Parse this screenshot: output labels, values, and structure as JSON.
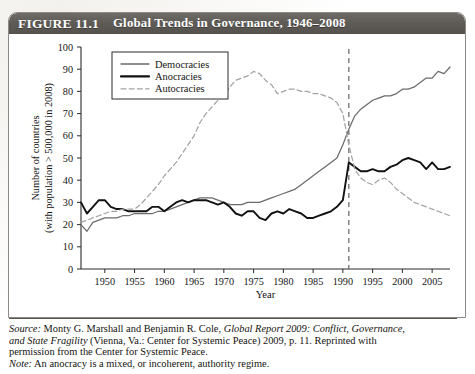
{
  "figure": {
    "number": "FIGURE 11.1",
    "title": "Global Trends in Governance, 1946–2008"
  },
  "caption": {
    "source_label": "Source:",
    "source_line1_a": " Monty G. Marshall and Benjamin R. Cole, ",
    "source_line1_italic": "Global Report 2009: Conflict, Governance,",
    "source_line2_italic": "and State Fragility",
    "source_line2_a": " (Vienna, Va.: Center for Systemic Peace) 2009, p. 11. Reprinted with",
    "source_line3": "permission from the Center for Systemic Peace.",
    "note_label": "Note:",
    "note_text": " An anocracy is a mixed, or incoherent, authority regime."
  },
  "colors": {
    "democracies": "#6b6b6b",
    "anocracies": "#111111",
    "autocracies": "#a3a3a3",
    "axis": "#2b2b2b",
    "header_bg": "#5f5c58",
    "card_border": "#8d8a85",
    "marker_line": "#6e6e6e"
  },
  "chart_data": {
    "type": "line",
    "title": "Global Trends in Governance, 1946–2008",
    "xlabel": "Year",
    "ylabel": "Number of countries (with population > 500,000 in 2008)",
    "ylabel_line1": "Number of countries",
    "ylabel_line2": "(with population > 500,000 in 2008)",
    "xlim": [
      1946,
      2008
    ],
    "ylim": [
      0,
      100
    ],
    "xticks": [
      1950,
      1955,
      1960,
      1965,
      1970,
      1975,
      1980,
      1985,
      1990,
      1995,
      2000,
      2005
    ],
    "yticks": [
      0,
      10,
      20,
      30,
      40,
      50,
      60,
      70,
      80,
      90,
      100
    ],
    "grid": false,
    "legend_position": "top-left",
    "annotations": [
      {
        "type": "vline",
        "x": 1991,
        "style": "dashed",
        "label": ""
      }
    ],
    "x": [
      1946,
      1947,
      1948,
      1949,
      1950,
      1951,
      1952,
      1953,
      1954,
      1955,
      1956,
      1957,
      1958,
      1959,
      1960,
      1961,
      1962,
      1963,
      1964,
      1965,
      1966,
      1967,
      1968,
      1969,
      1970,
      1971,
      1972,
      1973,
      1974,
      1975,
      1976,
      1977,
      1978,
      1979,
      1980,
      1981,
      1982,
      1983,
      1984,
      1985,
      1986,
      1987,
      1988,
      1989,
      1990,
      1991,
      1992,
      1993,
      1994,
      1995,
      1996,
      1997,
      1998,
      1999,
      2000,
      2001,
      2002,
      2003,
      2004,
      2005,
      2006,
      2007,
      2008
    ],
    "series": [
      {
        "name": "Democracies",
        "style": "solid",
        "color": "#6b6b6b",
        "values": [
          20,
          17,
          21,
          22,
          23,
          23,
          23,
          24,
          24,
          25,
          25,
          25,
          25,
          26,
          26,
          27,
          28,
          29,
          30,
          31,
          32,
          32,
          32,
          31,
          30,
          29,
          29,
          29,
          30,
          30,
          30,
          31,
          32,
          33,
          34,
          35,
          36,
          38,
          40,
          42,
          44,
          46,
          48,
          50,
          56,
          63,
          69,
          72,
          74,
          76,
          77,
          78,
          78,
          79,
          81,
          81,
          82,
          84,
          86,
          86,
          89,
          88,
          91
        ]
      },
      {
        "name": "Anocracies",
        "style": "solid",
        "color": "#111111",
        "values": [
          30,
          25,
          28,
          31,
          31,
          28,
          27,
          27,
          26,
          26,
          26,
          26,
          28,
          28,
          26,
          28,
          30,
          31,
          30,
          31,
          31,
          31,
          30,
          29,
          30,
          28,
          25,
          24,
          26,
          26,
          23,
          22,
          25,
          26,
          25,
          27,
          26,
          25,
          23,
          23,
          24,
          25,
          26,
          28,
          31,
          48,
          46,
          44,
          44,
          45,
          44,
          44,
          46,
          47,
          49,
          50,
          49,
          48,
          45,
          48,
          45,
          45,
          46
        ]
      },
      {
        "name": "Autocracies",
        "style": "dashed",
        "color": "#a3a3a3",
        "values": [
          21,
          22,
          23,
          24,
          25,
          26,
          26,
          27,
          27,
          27,
          29,
          32,
          35,
          38,
          42,
          45,
          48,
          52,
          56,
          60,
          66,
          70,
          73,
          76,
          78,
          82,
          85,
          86,
          87,
          89,
          88,
          85,
          83,
          79,
          80,
          81,
          81,
          80,
          80,
          79,
          79,
          78,
          77,
          75,
          70,
          56,
          45,
          41,
          39,
          38,
          40,
          41,
          39,
          36,
          34,
          32,
          30,
          29,
          28,
          27,
          26,
          25,
          24
        ]
      }
    ]
  }
}
